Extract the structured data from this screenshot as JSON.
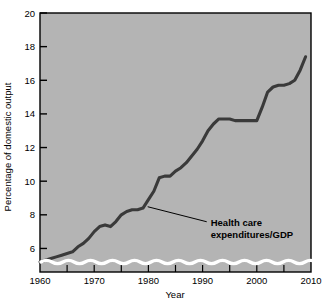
{
  "chart_data": {
    "type": "line",
    "title": "",
    "xlabel": "Year",
    "ylabel": "Percentage of domestic output",
    "xlim": [
      1960,
      2010
    ],
    "ylim": [
      4.6,
      20
    ],
    "grid": false,
    "legend": "none",
    "axis_break": true,
    "x_major_ticks": [
      1960,
      1970,
      1980,
      1990,
      2000,
      2010
    ],
    "x_minor_ticks": [
      1965,
      1975,
      1985,
      1995,
      2005
    ],
    "x_tick_labels": [
      "1960",
      "1970",
      "1980",
      "1990",
      "2000",
      "2010"
    ],
    "y_ticks": [
      6,
      8,
      10,
      12,
      14,
      16,
      18,
      20
    ],
    "y_tick_labels": [
      "6",
      "8",
      "10",
      "12",
      "14",
      "16",
      "18",
      "20"
    ],
    "series": [
      {
        "name": "Health care expenditures/GDP",
        "color": "#3a3a3a",
        "x": [
          1960,
          1961,
          1962,
          1963,
          1964,
          1965,
          1966,
          1967,
          1968,
          1969,
          1970,
          1971,
          1972,
          1973,
          1974,
          1975,
          1976,
          1977,
          1978,
          1979,
          1980,
          1981,
          1982,
          1983,
          1984,
          1985,
          1986,
          1987,
          1988,
          1989,
          1990,
          1991,
          1992,
          1993,
          1994,
          1995,
          1996,
          1997,
          1998,
          1999,
          2000,
          2001,
          2002,
          2003,
          2004,
          2005,
          2006,
          2007,
          2008,
          2009
        ],
        "values": [
          5.2,
          5.3,
          5.4,
          5.5,
          5.6,
          5.7,
          5.8,
          6.1,
          6.3,
          6.6,
          7.0,
          7.3,
          7.4,
          7.3,
          7.6,
          8.0,
          8.2,
          8.3,
          8.3,
          8.4,
          8.9,
          9.4,
          10.2,
          10.3,
          10.3,
          10.6,
          10.8,
          11.1,
          11.5,
          11.9,
          12.4,
          13.0,
          13.4,
          13.7,
          13.7,
          13.7,
          13.6,
          13.6,
          13.6,
          13.6,
          13.6,
          14.4,
          15.3,
          15.6,
          15.7,
          15.7,
          15.8,
          16.0,
          16.6,
          17.4
        ]
      }
    ],
    "annotations": [
      {
        "label_line1": "Health care",
        "label_line2": "expenditures/GDP",
        "point_x": 1979.5,
        "point_y": 8.6,
        "text_x": 1991.5,
        "text_y": 7.35
      }
    ],
    "colors": {
      "plot_background": "#b4b4b4",
      "line": "#3a3a3a",
      "axis": "#000000",
      "break_wave": "#ffffff",
      "page_background": "#ffffff"
    }
  }
}
